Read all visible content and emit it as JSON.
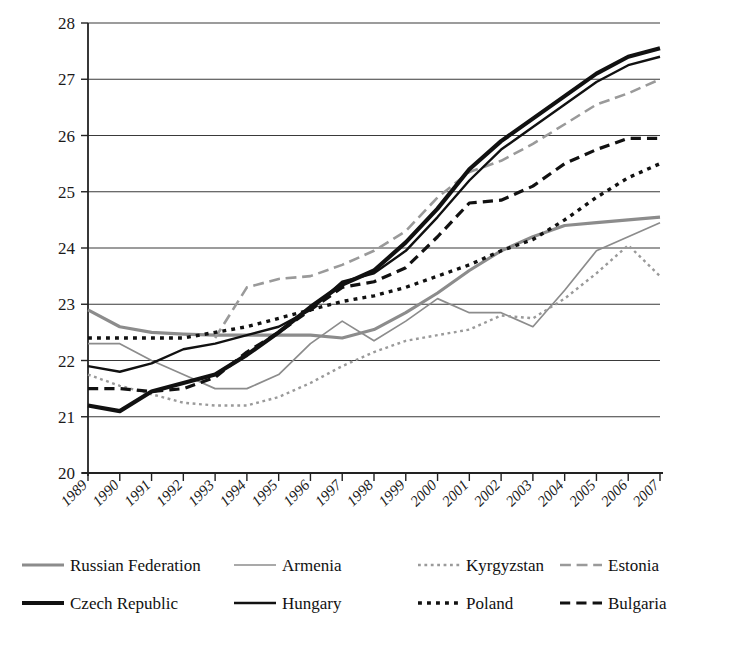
{
  "chart_data": {
    "type": "line",
    "title": "",
    "xlabel": "",
    "ylabel": "",
    "xlim": [
      1989,
      2007
    ],
    "ylim": [
      20,
      28
    ],
    "ytick_values": [
      20,
      21,
      22,
      23,
      24,
      25,
      26,
      27,
      28
    ],
    "ytick_labels": [
      "20",
      "21",
      "22",
      "23",
      "24",
      "25",
      "26",
      "27",
      "28"
    ],
    "grid": "horizontal",
    "legend_position": "bottom",
    "x": [
      1989,
      1990,
      1991,
      1992,
      1993,
      1994,
      1995,
      1996,
      1997,
      1998,
      1999,
      2000,
      2001,
      2002,
      2003,
      2004,
      2005,
      2006,
      2007
    ],
    "xtick_labels": [
      "1989",
      "1990",
      "1991",
      "1992",
      "1993",
      "1994",
      "1995",
      "1996",
      "1997",
      "1998",
      "1999",
      "2000",
      "2001",
      "2002",
      "2003",
      "2004",
      "2005",
      "2006",
      "2007"
    ],
    "series": [
      {
        "name": "Russian Federation",
        "color": "#8c8c8c",
        "style": "solid",
        "width": 3.2,
        "values": [
          22.9,
          22.6,
          22.5,
          22.47,
          22.45,
          22.45,
          22.45,
          22.45,
          22.4,
          22.55,
          22.85,
          23.2,
          23.6,
          23.95,
          24.2,
          24.4,
          24.45,
          24.5,
          24.55
        ]
      },
      {
        "name": "Armenia",
        "color": "#8c8c8c",
        "style": "solid",
        "width": 1.7,
        "values": [
          22.3,
          22.3,
          22.0,
          21.75,
          21.5,
          21.5,
          21.75,
          22.3,
          22.7,
          22.35,
          22.7,
          23.1,
          22.85,
          22.85,
          22.6,
          23.25,
          23.95,
          24.2,
          24.45
        ]
      },
      {
        "name": "Kyrgyzstan",
        "color": "#9a9a9a",
        "style": "dotted",
        "width": 2.4,
        "values": [
          21.75,
          21.55,
          21.4,
          21.25,
          21.2,
          21.2,
          21.35,
          21.6,
          21.9,
          22.15,
          22.35,
          22.45,
          22.55,
          22.8,
          22.75,
          23.1,
          23.55,
          24.05,
          23.5
        ]
      },
      {
        "name": "Estonia",
        "color": "#9a9a9a",
        "style": "dashed-long",
        "width": 2.6,
        "values": [
          null,
          null,
          null,
          null,
          22.4,
          23.3,
          23.45,
          23.5,
          23.7,
          23.95,
          24.3,
          24.9,
          25.35,
          25.55,
          25.85,
          26.2,
          26.55,
          26.75,
          27.0
        ]
      },
      {
        "name": "Czech Republic",
        "color": "#111111",
        "style": "solid",
        "width": 4.2,
        "values": [
          21.2,
          21.1,
          21.45,
          21.6,
          21.75,
          22.1,
          22.5,
          22.95,
          23.35,
          23.6,
          24.1,
          24.7,
          25.4,
          25.9,
          26.3,
          26.7,
          27.1,
          27.4,
          27.55
        ]
      },
      {
        "name": "Hungary",
        "color": "#111111",
        "style": "solid",
        "width": 2.4,
        "values": [
          21.9,
          21.8,
          21.95,
          22.2,
          22.3,
          22.45,
          22.6,
          22.9,
          23.4,
          23.55,
          23.95,
          24.55,
          25.2,
          25.75,
          26.15,
          26.55,
          26.95,
          27.25,
          27.4
        ]
      },
      {
        "name": "Poland",
        "color": "#111111",
        "style": "dotted",
        "width": 3.4,
        "values": [
          22.4,
          22.4,
          22.4,
          22.4,
          22.5,
          22.6,
          22.75,
          22.9,
          23.05,
          23.15,
          23.3,
          23.5,
          23.7,
          23.95,
          24.15,
          24.5,
          24.9,
          25.25,
          25.5
        ]
      },
      {
        "name": "Bulgaria",
        "color": "#111111",
        "style": "dashed",
        "width": 3.2,
        "values": [
          21.5,
          21.5,
          21.45,
          21.5,
          21.7,
          22.15,
          22.5,
          22.9,
          23.3,
          23.4,
          23.65,
          24.2,
          24.8,
          24.85,
          25.1,
          25.5,
          25.75,
          25.95,
          25.95
        ]
      }
    ]
  },
  "legend": {
    "rows": [
      [
        {
          "label": "Russian Federation",
          "series": "Russian Federation"
        },
        {
          "label": "Armenia",
          "series": "Armenia"
        },
        {
          "label": "Kyrgyzstan",
          "series": "Kyrgyzstan"
        },
        {
          "label": "Estonia",
          "series": "Estonia"
        }
      ],
      [
        {
          "label": "Czech Republic",
          "series": "Czech Republic"
        },
        {
          "label": "Hungary",
          "series": "Hungary"
        },
        {
          "label": "Poland",
          "series": "Poland"
        },
        {
          "label": "Bulgaria",
          "series": "Bulgaria"
        }
      ]
    ]
  }
}
